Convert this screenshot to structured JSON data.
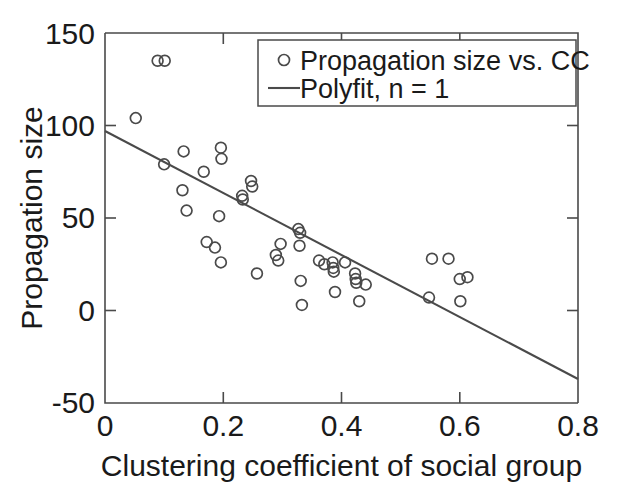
{
  "chart_data": {
    "type": "scatter",
    "title": "",
    "xlabel": "Clustering coefficient of social group",
    "ylabel": "Propagation size",
    "xlim": [
      0,
      0.8
    ],
    "ylim": [
      -50,
      150
    ],
    "xticks": [
      0,
      0.2,
      0.4,
      0.6,
      0.8
    ],
    "xticklabels": [
      "0",
      "0.2",
      "0.4",
      "0.6",
      "0.8"
    ],
    "yticks": [
      -50,
      0,
      50,
      100,
      150
    ],
    "yticklabels": [
      "-50",
      "0",
      "50",
      "100",
      "150"
    ],
    "grid": false,
    "legend_position": "top-right",
    "series": [
      {
        "name": "Propagation size vs. CC",
        "type": "scatter",
        "marker": "circle-open",
        "color": "#4a4a4a",
        "points": [
          [
            0.052,
            104
          ],
          [
            0.089,
            135
          ],
          [
            0.101,
            135
          ],
          [
            0.1,
            79
          ],
          [
            0.133,
            86
          ],
          [
            0.131,
            65
          ],
          [
            0.138,
            54
          ],
          [
            0.167,
            75
          ],
          [
            0.172,
            37
          ],
          [
            0.186,
            34
          ],
          [
            0.196,
            88
          ],
          [
            0.197,
            82
          ],
          [
            0.193,
            51
          ],
          [
            0.196,
            26
          ],
          [
            0.232,
            62
          ],
          [
            0.233,
            60
          ],
          [
            0.247,
            70
          ],
          [
            0.249,
            67
          ],
          [
            0.257,
            20
          ],
          [
            0.289,
            30
          ],
          [
            0.293,
            27
          ],
          [
            0.297,
            36
          ],
          [
            0.327,
            44
          ],
          [
            0.33,
            42
          ],
          [
            0.329,
            35
          ],
          [
            0.331,
            16
          ],
          [
            0.333,
            3
          ],
          [
            0.362,
            27
          ],
          [
            0.371,
            25
          ],
          [
            0.385,
            26
          ],
          [
            0.386,
            23
          ],
          [
            0.387,
            21
          ],
          [
            0.389,
            10
          ],
          [
            0.406,
            26
          ],
          [
            0.423,
            20
          ],
          [
            0.424,
            17
          ],
          [
            0.425,
            15
          ],
          [
            0.43,
            5
          ],
          [
            0.441,
            14
          ],
          [
            0.548,
            7
          ],
          [
            0.553,
            28
          ],
          [
            0.581,
            28
          ],
          [
            0.6,
            17
          ],
          [
            0.601,
            5
          ],
          [
            0.613,
            18
          ]
        ]
      },
      {
        "name": "Polyfit, n = 1",
        "type": "line",
        "color": "#4a4a4a",
        "fit": {
          "slope": -167.5,
          "intercept": 97,
          "x_start": 0,
          "x_end": 0.8,
          "y_start": 97,
          "y_end": -37
        }
      }
    ]
  },
  "legend": {
    "entries": [
      {
        "label": "Propagation size vs. CC",
        "glyph": "circle-marker"
      },
      {
        "label": "Polyfit, n = 1",
        "glyph": "line-marker"
      }
    ]
  }
}
